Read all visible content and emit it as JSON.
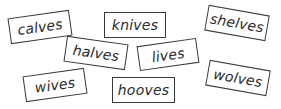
{
  "word_cards": [
    {
      "word": "calves"
    },
    {
      "word": "knives"
    },
    {
      "word": "shelves"
    },
    {
      "word": "halves"
    },
    {
      "word": "lives"
    },
    {
      "word": "wives"
    },
    {
      "word": "hooves"
    },
    {
      "word": "wolves"
    }
  ]
}
